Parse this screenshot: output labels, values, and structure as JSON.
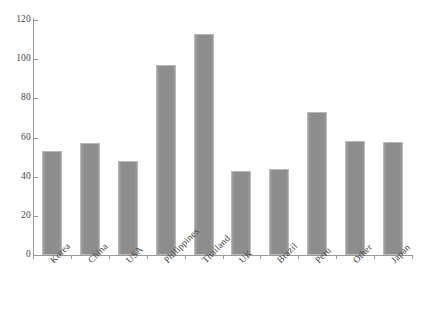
{
  "chart_data": {
    "type": "bar",
    "title": "",
    "subtitle": "",
    "xlabel": "",
    "ylabel": "",
    "categories": [
      "Korea",
      "China",
      "USA",
      "Philippines",
      "Thailand",
      "UK",
      "Brazil",
      "Peru",
      "Other",
      "Japan"
    ],
    "values": [
      53,
      57,
      48,
      97,
      113,
      43,
      44,
      73,
      58,
      57.5
    ],
    "ylim": [
      0,
      120
    ],
    "yticks": [
      0,
      20,
      40,
      60,
      80,
      100,
      120
    ],
    "ytick_labels": [
      "0",
      "20",
      "40",
      "60",
      "80",
      "100",
      "120"
    ],
    "grid": false,
    "legend": null,
    "legend_position": "none",
    "bar_color": "#8d8d8d",
    "bar_edge_color": "#b9b9b9",
    "axis_color": "#9a9a9a",
    "background_color": "#ffffff",
    "xtick_label_rotation": -45
  }
}
